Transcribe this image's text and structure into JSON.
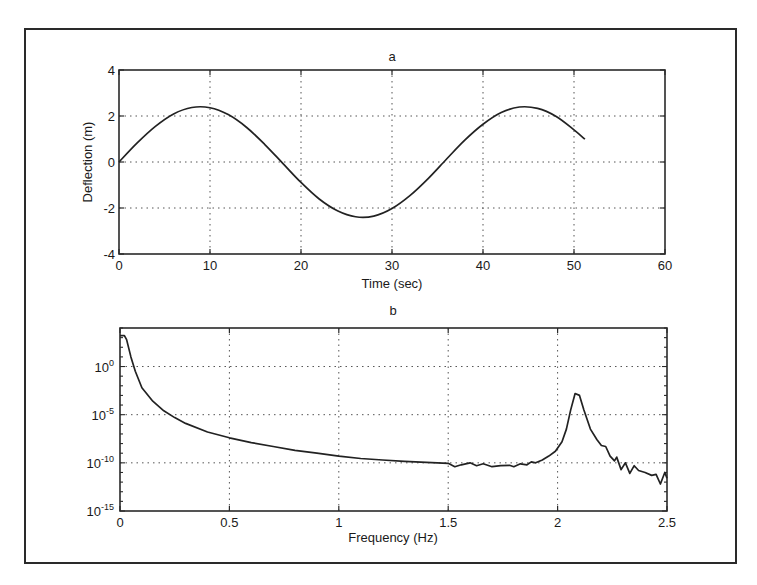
{
  "chart_data": [
    {
      "type": "line",
      "title": "a",
      "xlabel": "Time (sec)",
      "ylabel": "Deflection (m)",
      "xlim": [
        0,
        60
      ],
      "ylim": [
        -4,
        4
      ],
      "xticks": [
        0,
        10,
        20,
        30,
        40,
        50,
        60
      ],
      "xtick_labels": [
        "0",
        "10",
        "20",
        "30",
        "40",
        "50",
        "60"
      ],
      "yticks": [
        4,
        2,
        0,
        -2,
        -4
      ],
      "ytick_labels": [
        "4",
        "2",
        "0",
        "-2",
        "-4"
      ],
      "grid": true,
      "series": [
        {
          "name": "deflection",
          "x": [
            0,
            2,
            4,
            6,
            8,
            10,
            12,
            14,
            16,
            18,
            20,
            22,
            24,
            26,
            28,
            30,
            32,
            34,
            36,
            38,
            40,
            42,
            44,
            46,
            48,
            50,
            51.2
          ],
          "y": [
            0,
            0.83,
            1.55,
            2.09,
            2.37,
            2.36,
            2.06,
            1.51,
            0.77,
            -0.06,
            -0.89,
            -1.61,
            -2.12,
            -2.38,
            -2.35,
            -2.02,
            -1.45,
            -0.71,
            0.13,
            0.95,
            1.64,
            2.15,
            2.39,
            2.33,
            1.99,
            1.4,
            0.99
          ]
        }
      ]
    },
    {
      "type": "line",
      "title": "b",
      "xlabel": "Frequency (Hz)",
      "ylabel": "",
      "yscale": "log",
      "xlim": [
        0,
        2.5
      ],
      "ylim_log10": [
        -15,
        4
      ],
      "xticks": [
        0,
        0.5,
        1,
        1.5,
        2,
        2.5
      ],
      "xtick_labels": [
        "0",
        "0.5",
        "1",
        "1.5",
        "2",
        "2.5"
      ],
      "yticks_log10": [
        0,
        -5,
        -10,
        -15
      ],
      "ytick_labels": [
        {
          "base": "10",
          "exp": "0"
        },
        {
          "base": "10",
          "exp": "-5"
        },
        {
          "base": "10",
          "exp": "-10"
        },
        {
          "base": "10",
          "exp": "-15"
        }
      ],
      "grid": true,
      "series": [
        {
          "name": "spectrum",
          "x": [
            0,
            0.02,
            0.03,
            0.05,
            0.07,
            0.1,
            0.15,
            0.2,
            0.25,
            0.3,
            0.4,
            0.5,
            0.6,
            0.7,
            0.8,
            0.9,
            1.0,
            1.1,
            1.2,
            1.3,
            1.4,
            1.5,
            1.53,
            1.56,
            1.6,
            1.63,
            1.66,
            1.7,
            1.74,
            1.78,
            1.8,
            1.83,
            1.86,
            1.88,
            1.9,
            1.93,
            1.96,
            1.99,
            2.02,
            2.04,
            2.06,
            2.08,
            2.1,
            2.12,
            2.15,
            2.18,
            2.2,
            2.22,
            2.24,
            2.26,
            2.27,
            2.29,
            2.31,
            2.33,
            2.35,
            2.37,
            2.4,
            2.43,
            2.45,
            2.47,
            2.49,
            2.5
          ],
          "log10_y": [
            3.2,
            3.2,
            2.8,
            1.0,
            -0.5,
            -2.2,
            -3.6,
            -4.6,
            -5.3,
            -5.9,
            -6.8,
            -7.4,
            -7.9,
            -8.3,
            -8.7,
            -9.0,
            -9.3,
            -9.55,
            -9.7,
            -9.85,
            -9.95,
            -10.05,
            -10.4,
            -10.2,
            -10.0,
            -10.3,
            -10.1,
            -10.4,
            -10.3,
            -10.25,
            -10.4,
            -10.1,
            -10.2,
            -9.9,
            -10.0,
            -9.7,
            -9.3,
            -8.8,
            -7.8,
            -6.5,
            -4.5,
            -2.8,
            -3.0,
            -4.5,
            -6.5,
            -7.6,
            -8.2,
            -8.3,
            -9.3,
            -9.8,
            -9.4,
            -10.7,
            -10.0,
            -11.1,
            -10.3,
            -10.8,
            -11.0,
            -11.3,
            -11.2,
            -12.2,
            -11.0,
            -11.6
          ]
        }
      ],
      "peak": {
        "frequency_hz": 2.08,
        "log10_value": -2.8
      }
    }
  ],
  "plot_a": {
    "title": "a",
    "xlabel": "Time (sec)",
    "ylabel": "Deflection (m)"
  },
  "plot_b": {
    "title": "b",
    "xlabel": "Frequency (Hz)"
  }
}
